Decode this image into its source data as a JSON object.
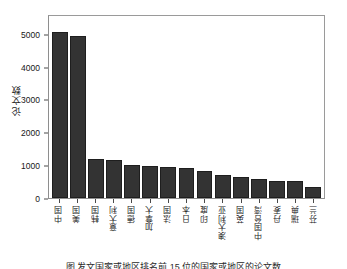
{
  "chart_data": {
    "type": "bar",
    "title": "",
    "subtitle": "",
    "xlabel": "",
    "ylabel": "论文数",
    "ylim": [
      0,
      5600
    ],
    "yticks": [
      0,
      1000,
      2000,
      3000,
      4000,
      5000
    ],
    "ytick_labels": [
      "0",
      "1000",
      "2000",
      "3000",
      "4000",
      "5000"
    ],
    "grid": false,
    "legend": null,
    "bar_color": "#333333",
    "bar_edge_color": "#1e1e1e",
    "frame_color": "#8e8e8e",
    "categories": [
      "中国",
      "美国",
      "韩国",
      "意大利",
      "德国",
      "加拿大",
      "法国",
      "日本",
      "印度",
      "澳大利亚",
      "英国",
      "中国台湾",
      "丹麦",
      "瑞典",
      "芬兰"
    ],
    "values": [
      5120,
      4990,
      1190,
      1170,
      1010,
      995,
      940,
      910,
      820,
      710,
      640,
      600,
      530,
      520,
      350
    ]
  },
  "caption": {
    "text": "图    发文国家或地区排名前 15 位的国家或地区的论文数"
  }
}
